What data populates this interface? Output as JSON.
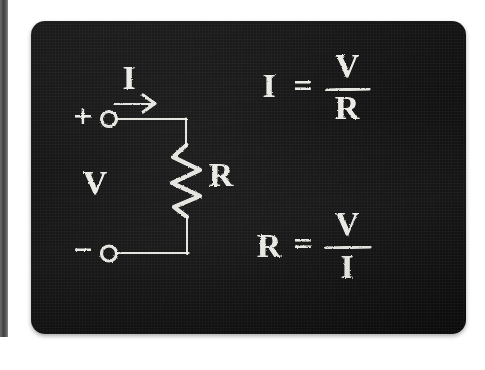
{
  "scene": {
    "medium": "chalkboard",
    "board_color": "#131313",
    "chalk_color": "#f2f1ec",
    "page_background": "#ffffff",
    "left_strip_color": "#4a4a4a"
  },
  "circuit": {
    "title": "ohms-law-circuit",
    "terminals": [
      {
        "id": "positive",
        "label": "+",
        "x": 52,
        "y": 97
      },
      {
        "id": "negative",
        "label": "−",
        "x": 52,
        "y": 232
      }
    ],
    "labels": [
      {
        "id": "current",
        "text": "I",
        "x": 98,
        "y": 60
      },
      {
        "id": "voltage",
        "text": "V",
        "x": 64,
        "y": 165
      },
      {
        "id": "resistance",
        "text": "R",
        "x": 182,
        "y": 155
      }
    ],
    "current_arrow": {
      "direction": "right",
      "x": 84,
      "y": 82,
      "length": 42
    },
    "resistor": {
      "type": "zigzag",
      "peaks": 4,
      "x": 155,
      "y_top": 124,
      "y_bottom": 196
    }
  },
  "formulas": [
    {
      "id": "current-formula",
      "text": "I = V/R",
      "lhs": "I",
      "equals": "=",
      "numerator": "V",
      "denominator": "R",
      "x": 232,
      "y": 70
    },
    {
      "id": "resistance-formula",
      "text": "R = V/I",
      "lhs": "R",
      "equals": "=",
      "numerator": "V",
      "denominator": "I",
      "x": 232,
      "y": 225
    }
  ]
}
